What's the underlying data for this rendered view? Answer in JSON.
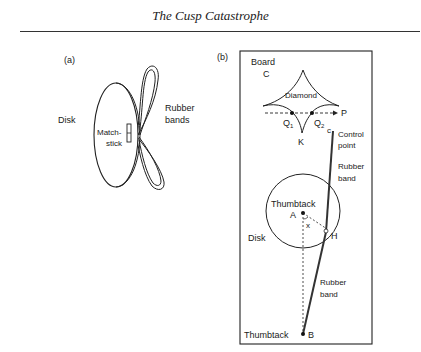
{
  "header": {
    "title": "The Cusp Catastrophe"
  },
  "panel_a": {
    "label": "(a)",
    "disk_label": "Disk",
    "matchstick_label_1": "Match-",
    "matchstick_label_2": "stick",
    "rubber_bands_label_1": "Rubber",
    "rubber_bands_label_2": "bands"
  },
  "panel_b": {
    "label": "(b)",
    "board_label": "Board",
    "c_upper_label": "C",
    "diamond_label": "Diamond",
    "p_label": "P",
    "q1_label": "Q",
    "q1_sub": "1",
    "q2_label": "Q",
    "q2_sub": "2",
    "k_label": "K",
    "c_lower_label": "c",
    "control_point_label_1": "Control",
    "control_point_label_2": "point",
    "rubber_band_upper_1": "Rubber",
    "rubber_band_upper_2": "band",
    "thumbtack_upper": "Thumbtack",
    "a_label": "A",
    "x_label": "x",
    "h_label": "H",
    "disk_label": "Disk",
    "rubber_band_lower_1": "Rubber",
    "rubber_band_lower_2": "band",
    "thumbtack_lower": "Thumbtack",
    "b_label": "B"
  }
}
